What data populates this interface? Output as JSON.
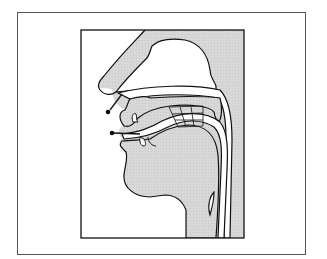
{
  "diagram": {
    "type": "anatomical-cross-section",
    "colors": {
      "tissue_fill": "#d6d6d6",
      "background": "#ffffff",
      "line": "#111111"
    },
    "arrows": [
      {
        "name": "nasal-airflow-arrow",
        "from": "nasal cavity",
        "direction": "out through nostril"
      },
      {
        "name": "oral-airflow-arrow",
        "from": "oral cavity",
        "direction": "out through lips"
      }
    ],
    "regions": [
      "nose",
      "nasal-cavity",
      "palate",
      "tongue",
      "pharynx",
      "larynx",
      "grid-region"
    ]
  }
}
